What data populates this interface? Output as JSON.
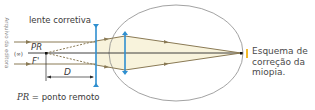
{
  "credit": "Arquivo da editora",
  "diagram": {
    "corrective_lens_label": "lente corretiva",
    "point_label": "PR",
    "focus_label": "F'",
    "distance_label": "D",
    "infinity_label": "(∞)",
    "colors": {
      "lens": "#2f8fd0",
      "ray": "#8a7a55",
      "beam_fill": "#f8f3dc",
      "axis": "#2a2a2a",
      "eye_outline": "#8a8a8a",
      "caption_marker": "#f2b92a"
    }
  },
  "legend": {
    "symbol": "PR",
    "text": " = ponto remoto"
  },
  "caption": {
    "text": "Esquema de correção da miopia."
  }
}
